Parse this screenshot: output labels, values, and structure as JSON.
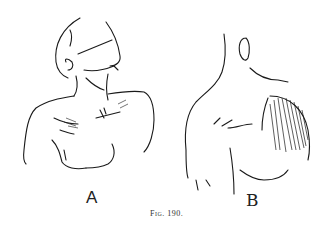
{
  "figure": {
    "panels": [
      {
        "label": "A",
        "description": "male torso, head tilted back"
      },
      {
        "label": "B",
        "description": "male back and shoulder with shaded muscle"
      }
    ],
    "caption": "Fig. 190."
  }
}
